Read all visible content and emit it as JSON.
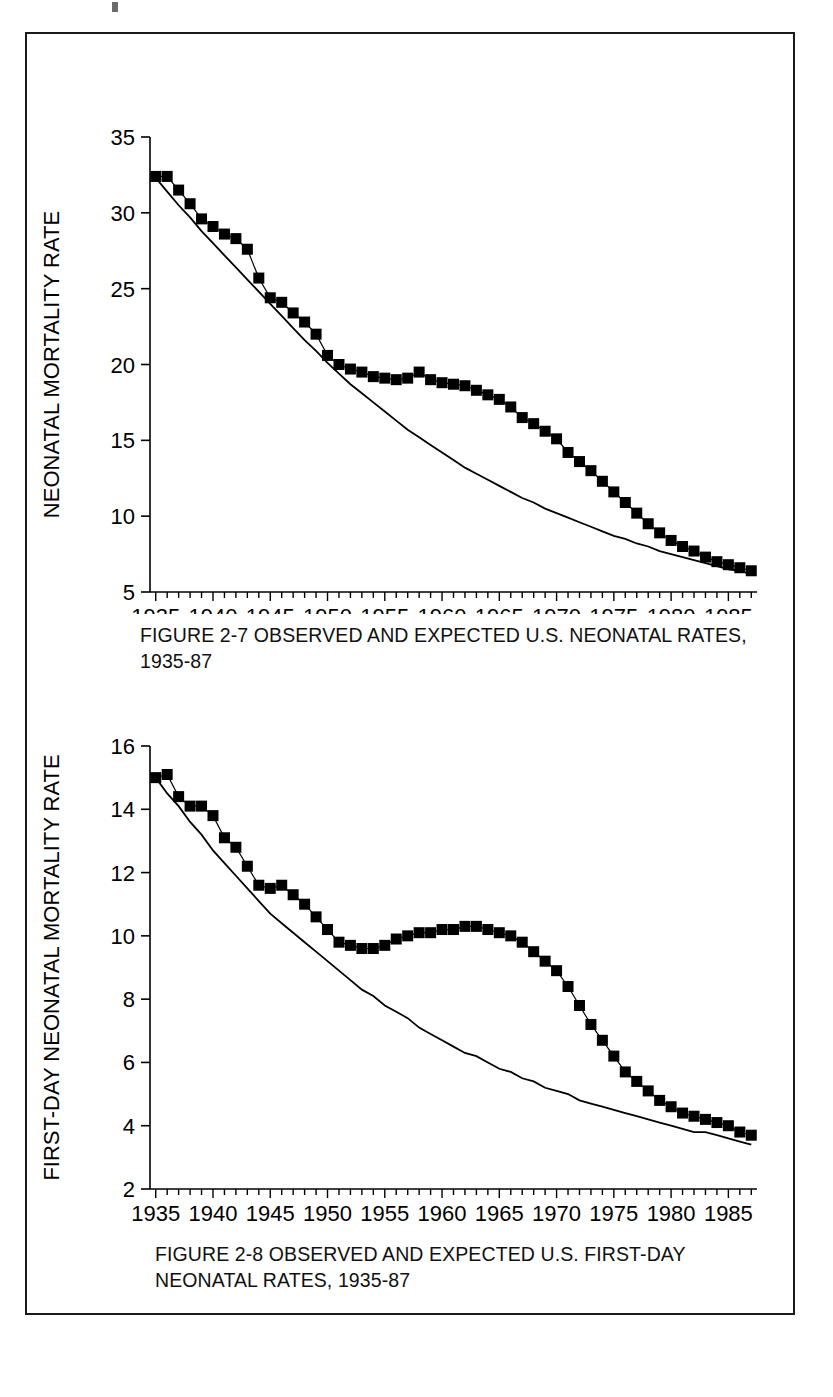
{
  "page": {
    "background_color": "#ffffff",
    "border_color": "#1a1a1a",
    "ink_color": "#000000"
  },
  "figures": [
    {
      "id": "figure-2-7",
      "caption": "FIGURE 2-7  OBSERVED AND EXPECTED U.S. NEONATAL RATES,\n1935-87",
      "chart_data": {
        "type": "line",
        "title": "FIGURE 2-7  OBSERVED AND EXPECTED U.S. NEONATAL RATES, 1935-87",
        "xlabel": "",
        "ylabel": "NEONATAL MORTALITY RATE",
        "xlim": [
          1934.5,
          1987.5
        ],
        "ylim": [
          5,
          35
        ],
        "yticks": [
          5,
          10,
          15,
          20,
          25,
          30,
          35
        ],
        "xticks": [
          1935,
          1940,
          1945,
          1950,
          1955,
          1960,
          1965,
          1970,
          1975,
          1980,
          1985
        ],
        "xtick_labels": [
          "1935",
          "1940",
          "1945",
          "1950",
          "1955",
          "1960",
          "1965",
          "1970",
          "1975",
          "1980",
          "1985"
        ],
        "ytick_labels": [
          "5",
          "10",
          "15",
          "20",
          "25",
          "30",
          "35"
        ],
        "minor_xtick_interval": 1,
        "grid": false,
        "legend": "none",
        "x": [
          1935,
          1936,
          1937,
          1938,
          1939,
          1940,
          1941,
          1942,
          1943,
          1944,
          1945,
          1946,
          1947,
          1948,
          1949,
          1950,
          1951,
          1952,
          1953,
          1954,
          1955,
          1956,
          1957,
          1958,
          1959,
          1960,
          1961,
          1962,
          1963,
          1964,
          1965,
          1966,
          1967,
          1968,
          1969,
          1970,
          1971,
          1972,
          1973,
          1974,
          1975,
          1976,
          1977,
          1978,
          1979,
          1980,
          1981,
          1982,
          1983,
          1984,
          1985,
          1986,
          1987
        ],
        "series": [
          {
            "name": "Observed",
            "marker": "filled-square",
            "values": [
              32.4,
              32.4,
              31.5,
              30.6,
              29.6,
              29.1,
              28.6,
              28.3,
              27.6,
              25.7,
              24.4,
              24.1,
              23.4,
              22.8,
              22.0,
              20.6,
              20.0,
              19.7,
              19.5,
              19.2,
              19.1,
              19.0,
              19.1,
              19.5,
              19.0,
              18.8,
              18.7,
              18.6,
              18.3,
              18.0,
              17.7,
              17.2,
              16.5,
              16.1,
              15.6,
              15.1,
              14.2,
              13.6,
              13.0,
              12.3,
              11.6,
              10.9,
              10.2,
              9.5,
              8.9,
              8.4,
              8.0,
              7.7,
              7.3,
              7.0,
              6.8,
              6.6,
              6.4
            ],
            "color": "#000000"
          },
          {
            "name": "Expected",
            "marker": "none",
            "values": [
              32.3,
              31.4,
              30.5,
              29.7,
              28.8,
              28.0,
              27.2,
              26.4,
              25.6,
              24.8,
              24.0,
              23.2,
              22.4,
              21.6,
              20.9,
              20.1,
              19.4,
              18.7,
              18.1,
              17.5,
              16.9,
              16.3,
              15.7,
              15.2,
              14.7,
              14.2,
              13.7,
              13.2,
              12.8,
              12.4,
              12.0,
              11.6,
              11.2,
              10.9,
              10.5,
              10.2,
              9.9,
              9.6,
              9.3,
              9.0,
              8.7,
              8.5,
              8.2,
              8.0,
              7.7,
              7.5,
              7.3,
              7.1,
              6.9,
              6.7,
              6.5,
              6.4,
              6.2
            ],
            "color": "#000000"
          }
        ]
      }
    },
    {
      "id": "figure-2-8",
      "caption": "FIGURE 2-8  OBSERVED AND EXPECTED U.S. FIRST-DAY\nNEONATAL RATES, 1935-87",
      "chart_data": {
        "type": "line",
        "title": "FIGURE 2-8  OBSERVED AND EXPECTED U.S. FIRST-DAY NEONATAL RATES, 1935-87",
        "xlabel": "",
        "ylabel": "FIRST-DAY NEONATAL MORTALITY RATE",
        "xlim": [
          1934.5,
          1987.5
        ],
        "ylim": [
          2,
          16
        ],
        "yticks": [
          2,
          4,
          6,
          8,
          10,
          12,
          14,
          16
        ],
        "xticks": [
          1935,
          1940,
          1945,
          1950,
          1955,
          1960,
          1965,
          1970,
          1975,
          1980,
          1985
        ],
        "xtick_labels": [
          "1935",
          "1940",
          "1945",
          "1950",
          "1955",
          "1960",
          "1965",
          "1970",
          "1975",
          "1980",
          "1985"
        ],
        "ytick_labels": [
          "2",
          "4",
          "6",
          "8",
          "10",
          "12",
          "14",
          "16"
        ],
        "minor_xtick_interval": 1,
        "grid": false,
        "legend": "none",
        "x": [
          1935,
          1936,
          1937,
          1938,
          1939,
          1940,
          1941,
          1942,
          1943,
          1944,
          1945,
          1946,
          1947,
          1948,
          1949,
          1950,
          1951,
          1952,
          1953,
          1954,
          1955,
          1956,
          1957,
          1958,
          1959,
          1960,
          1961,
          1962,
          1963,
          1964,
          1965,
          1966,
          1967,
          1968,
          1969,
          1970,
          1971,
          1972,
          1973,
          1974,
          1975,
          1976,
          1977,
          1978,
          1979,
          1980,
          1981,
          1982,
          1983,
          1984,
          1985,
          1986,
          1987
        ],
        "series": [
          {
            "name": "Observed",
            "marker": "filled-square",
            "values": [
              15.0,
              15.1,
              14.4,
              14.1,
              14.1,
              13.8,
              13.1,
              12.8,
              12.2,
              11.6,
              11.5,
              11.6,
              11.3,
              11.0,
              10.6,
              10.2,
              9.8,
              9.7,
              9.6,
              9.6,
              9.7,
              9.9,
              10.0,
              10.1,
              10.1,
              10.2,
              10.2,
              10.3,
              10.3,
              10.2,
              10.1,
              10.0,
              9.8,
              9.5,
              9.2,
              8.9,
              8.4,
              7.8,
              7.2,
              6.7,
              6.2,
              5.7,
              5.4,
              5.1,
              4.8,
              4.6,
              4.4,
              4.3,
              4.2,
              4.1,
              4.0,
              3.8,
              3.7
            ],
            "color": "#000000"
          },
          {
            "name": "Expected",
            "marker": "none",
            "values": [
              15.0,
              14.5,
              14.1,
              13.6,
              13.2,
              12.7,
              12.3,
              11.9,
              11.5,
              11.1,
              10.7,
              10.4,
              10.1,
              9.8,
              9.5,
              9.2,
              8.9,
              8.6,
              8.3,
              8.1,
              7.8,
              7.6,
              7.4,
              7.1,
              6.9,
              6.7,
              6.5,
              6.3,
              6.2,
              6.0,
              5.8,
              5.7,
              5.5,
              5.4,
              5.2,
              5.1,
              5.0,
              4.8,
              4.7,
              4.6,
              4.5,
              4.4,
              4.3,
              4.2,
              4.1,
              4.0,
              3.9,
              3.8,
              3.8,
              3.7,
              3.6,
              3.5,
              3.4
            ],
            "color": "#000000"
          }
        ]
      }
    }
  ]
}
